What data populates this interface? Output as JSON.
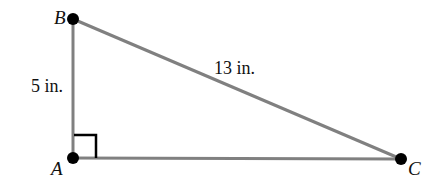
{
  "diagram": {
    "type": "right-triangle",
    "vertices": [
      {
        "name": "B",
        "label": "B"
      },
      {
        "name": "A",
        "label": "A",
        "right_angle": true
      },
      {
        "name": "C",
        "label": "C"
      }
    ],
    "sides": [
      {
        "endpoints": [
          "A",
          "B"
        ],
        "label": "5 in."
      },
      {
        "endpoints": [
          "B",
          "C"
        ],
        "label": "13 in."
      },
      {
        "endpoints": [
          "A",
          "C"
        ],
        "label": ""
      }
    ],
    "colors": {
      "line": "#808080",
      "point": "#000000",
      "right_angle_marker": "#000000",
      "text": "#111111"
    }
  }
}
